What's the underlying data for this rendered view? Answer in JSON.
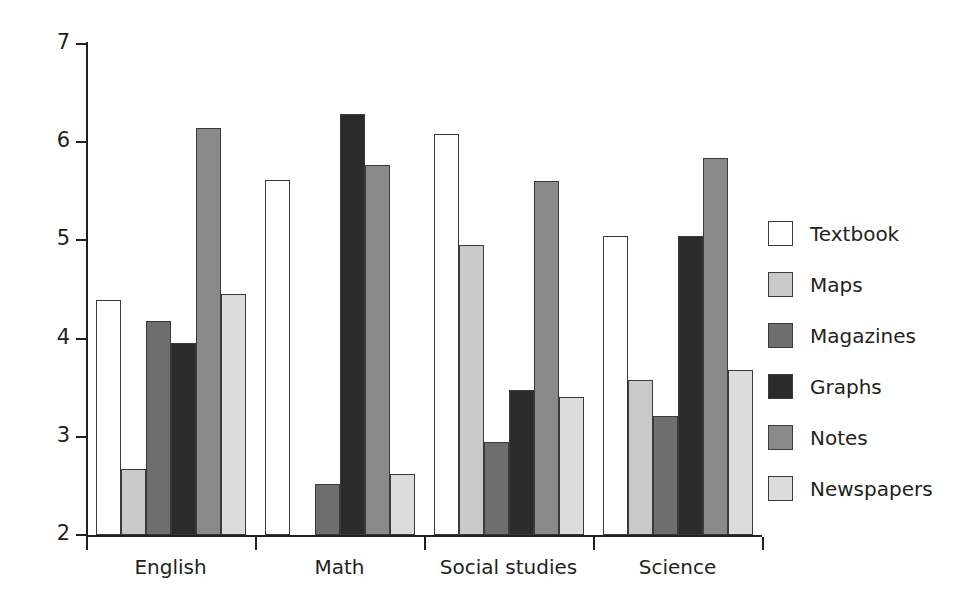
{
  "chart_data": {
    "type": "bar",
    "title": "",
    "subtitle": "",
    "xlabel": "",
    "ylabel": "",
    "categories": [
      "English",
      "Math",
      "Social studies",
      "Science"
    ],
    "ylim": [
      2,
      7
    ],
    "yticks": [
      2,
      3,
      4,
      5,
      6,
      7
    ],
    "ytick_labels": [
      "2",
      "3",
      "4",
      "5",
      "6",
      "7"
    ],
    "grid": false,
    "legend_position": "right",
    "series": [
      {
        "name": "Textbook",
        "color": "#ffffff",
        "values": [
          4.39,
          5.62,
          6.08,
          5.05
        ]
      },
      {
        "name": "Maps",
        "color": "#c9c9c9",
        "values": [
          2.67,
          2.0,
          4.95,
          3.58
        ]
      },
      {
        "name": "Magazines",
        "color": "#6e6e6e",
        "values": [
          4.18,
          2.52,
          2.95,
          3.21
        ]
      },
      {
        "name": "Graphs",
        "color": "#2b2b2b",
        "values": [
          3.96,
          6.29,
          3.48,
          5.04
        ]
      },
      {
        "name": "Notes",
        "color": "#8a8a8a",
        "values": [
          6.14,
          5.77,
          5.61,
          5.84
        ]
      },
      {
        "name": "Newspapers",
        "color": "#dcdcdc",
        "values": [
          4.45,
          2.62,
          3.41,
          3.68
        ]
      }
    ]
  },
  "axes": {
    "y_axis_name": "y-axis",
    "x_axis_name": "x-axis"
  },
  "colors": {
    "axis": "#231f20",
    "bar_outline": "#3a3a3a",
    "background": "#ffffff"
  }
}
